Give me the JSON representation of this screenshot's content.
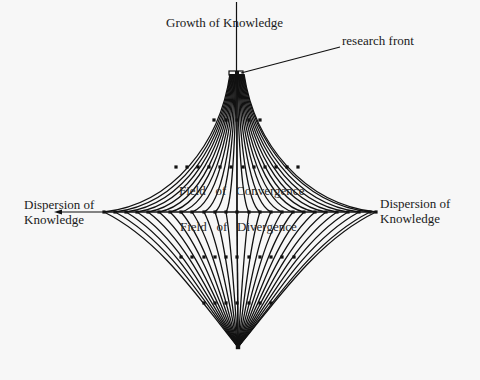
{
  "diagram": {
    "title_axis_label": "Growth of Knowledge",
    "research_front_label": "research front",
    "left_label_line1": "Dispersion of",
    "left_label_line2": "Knowledge",
    "right_label_line1": "Dispersion of",
    "right_label_line2": "Knowledge",
    "upper_field_label": "Field   of   Convergence",
    "lower_field_label": "Field   of   Divergence",
    "colors": {
      "background": "#f7f7f7",
      "ink": "#111111"
    },
    "nodes": {
      "top_apex": [
        237,
        73
      ],
      "row_y120": [
        214,
        226,
        237,
        249,
        260
      ],
      "row_y167": [
        176,
        187,
        198,
        209,
        220,
        231,
        243,
        254,
        265,
        276,
        287,
        298
      ],
      "midline_y212": [
        104,
        115,
        126,
        137,
        148,
        159,
        170,
        181,
        192,
        204,
        215,
        226,
        237,
        249,
        260,
        271,
        282,
        293,
        304,
        315,
        326,
        337,
        348,
        359,
        370,
        376
      ],
      "row_y257": [
        181,
        192,
        204,
        215,
        226,
        237,
        249,
        260,
        271,
        282,
        294
      ],
      "row_y303": [
        204,
        215,
        226,
        237,
        249,
        260,
        271
      ],
      "bottom_apex": [
        238,
        347
      ]
    }
  }
}
